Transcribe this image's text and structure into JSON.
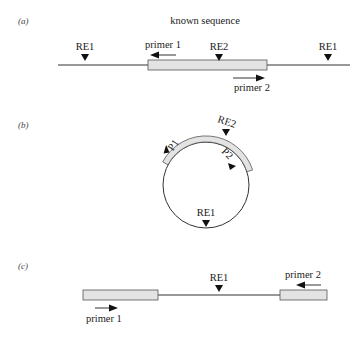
{
  "panels": {
    "a": {
      "label": "(a)",
      "title": "known sequence",
      "sites": [
        {
          "name": "RE1",
          "x": 85
        },
        {
          "name": "RE2",
          "x": 219
        },
        {
          "name": "RE1",
          "x": 328
        }
      ],
      "primer1": {
        "label": "primer 1",
        "direction": "left"
      },
      "primer2": {
        "label": "primer 2",
        "direction": "right"
      }
    },
    "b": {
      "label": "(b)",
      "sites": [
        {
          "name": "RE2"
        },
        {
          "name": "RE1"
        }
      ],
      "primer1": {
        "label": "P1"
      },
      "primer2": {
        "label": "P2"
      }
    },
    "c": {
      "label": "(c)",
      "sites": [
        {
          "name": "RE1"
        }
      ],
      "primer1": {
        "label": "primer 1",
        "direction": "right"
      },
      "primer2": {
        "label": "primer 2",
        "direction": "left"
      }
    }
  },
  "colors": {
    "line": "#333333",
    "known_sequence_fill": "#e3e3e3",
    "marker": "#111111"
  }
}
